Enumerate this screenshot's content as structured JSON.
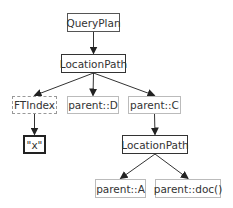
{
  "diagram": {
    "type": "tree",
    "nodes": [
      {
        "id": "queryplan",
        "label": "QueryPlan",
        "kind": "plan",
        "x": 67,
        "y": 13,
        "w": 53,
        "h": 19
      },
      {
        "id": "locpath1",
        "label": "LocationPath",
        "kind": "path",
        "x": 61,
        "y": 54,
        "w": 65,
        "h": 19
      },
      {
        "id": "ftindex",
        "label": "FTIndex",
        "kind": "index",
        "x": 12,
        "y": 96,
        "w": 45,
        "h": 18
      },
      {
        "id": "parentD",
        "label": "parent::D",
        "kind": "step",
        "x": 67,
        "y": 96,
        "w": 52,
        "h": 18
      },
      {
        "id": "parentC",
        "label": "parent::C",
        "kind": "step",
        "x": 128,
        "y": 96,
        "w": 53,
        "h": 18
      },
      {
        "id": "textx",
        "label": "\"x\"",
        "kind": "text",
        "x": 23,
        "y": 135,
        "w": 23,
        "h": 19
      },
      {
        "id": "locpath2",
        "label": "LocationPath",
        "kind": "path",
        "x": 122,
        "y": 135,
        "w": 66,
        "h": 19
      },
      {
        "id": "parentA",
        "label": "parent::A",
        "kind": "step",
        "x": 95,
        "y": 179,
        "w": 51,
        "h": 19
      },
      {
        "id": "parentdoc",
        "label": "parent::doc()",
        "kind": "step",
        "x": 155,
        "y": 179,
        "w": 66,
        "h": 19
      }
    ],
    "edges": [
      {
        "from": "queryplan",
        "to": "locpath1"
      },
      {
        "from": "locpath1",
        "to": "ftindex"
      },
      {
        "from": "locpath1",
        "to": "parentD"
      },
      {
        "from": "locpath1",
        "to": "parentC"
      },
      {
        "from": "ftindex",
        "to": "textx"
      },
      {
        "from": "parentC",
        "to": "locpath2"
      },
      {
        "from": "locpath2",
        "to": "parentA"
      },
      {
        "from": "locpath2",
        "to": "parentdoc"
      }
    ]
  }
}
